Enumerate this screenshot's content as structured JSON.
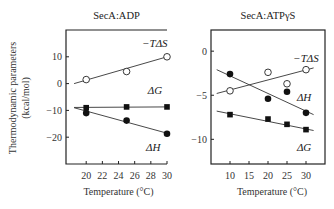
{
  "chart_data": [
    {
      "type": "scatter",
      "title": "SecA:ADP",
      "xlabel": "Temperature (°C)",
      "ylabel": "Thermodynamic parameters (kcal/mol)",
      "xlim": [
        17.5,
        30
      ],
      "ylim": [
        -30,
        20
      ],
      "xticks": [
        20,
        22,
        24,
        26,
        28,
        30
      ],
      "yticks": [
        10,
        0,
        -10,
        -20
      ],
      "grid": false,
      "series": [
        {
          "name": "−TΔS",
          "marker": "open-circle",
          "x": [
            20,
            25,
            30
          ],
          "y": [
            1.5,
            4.5,
            10
          ],
          "fit": [
            [
              18.5,
              0.0
            ],
            [
              30,
              10.0
            ]
          ]
        },
        {
          "name": "ΔG",
          "marker": "filled-square",
          "x": [
            20,
            25,
            30
          ],
          "y": [
            -9.0,
            -8.7,
            -8.7
          ],
          "fit": [
            [
              18.5,
              -8.9
            ],
            [
              30,
              -8.7
            ]
          ]
        },
        {
          "name": "ΔH",
          "marker": "filled-circle",
          "x": [
            20,
            25,
            30
          ],
          "y": [
            -11.0,
            -13.8,
            -18.7
          ],
          "fit": [
            [
              18.5,
              -9.0
            ],
            [
              30,
              -18.5
            ]
          ]
        }
      ],
      "labels": [
        {
          "text": "−TΔS",
          "x": 28.5,
          "y": 13.5
        },
        {
          "text": "ΔG",
          "x": 28.5,
          "y": -4
        },
        {
          "text": "ΔH",
          "x": 28.3,
          "y": -25
        }
      ]
    },
    {
      "type": "scatter",
      "title": "SecA:ATPγS",
      "xlabel": "Temperature (°C)",
      "ylabel": "",
      "xlim": [
        5,
        35
      ],
      "ylim": [
        -12.8,
        2.4
      ],
      "xticks": [
        10,
        15,
        20,
        25,
        30
      ],
      "yticks": [
        0,
        -5,
        -10
      ],
      "grid": false,
      "series": [
        {
          "name": "−TΔS",
          "marker": "open-circle",
          "x": [
            10,
            20,
            25,
            30
          ],
          "y": [
            -4.5,
            -2.4,
            -3.7,
            -2.1
          ],
          "fit": [
            [
              6.5,
              -4.8
            ],
            [
              32,
              -1.9
            ]
          ]
        },
        {
          "name": "ΔH",
          "marker": "filled-circle",
          "x": [
            10,
            20,
            25,
            30
          ],
          "y": [
            -2.6,
            -5.4,
            -4.6,
            -7.0
          ],
          "fit": [
            [
              6.5,
              -2.1
            ],
            [
              32,
              -7.2
            ]
          ]
        },
        {
          "name": "ΔG",
          "marker": "filled-square",
          "x": [
            10,
            20,
            25,
            30
          ],
          "y": [
            -7.2,
            -7.7,
            -8.3,
            -8.9
          ],
          "fit": [
            [
              6.5,
              -6.8
            ],
            [
              32,
              -9.0
            ]
          ]
        }
      ],
      "labels": [
        {
          "text": "−TΔS",
          "x": 30,
          "y": -1.2
        },
        {
          "text": "ΔH",
          "x": 29.5,
          "y": -5.7
        },
        {
          "text": "ΔG",
          "x": 29.5,
          "y": -11.3
        }
      ]
    }
  ]
}
